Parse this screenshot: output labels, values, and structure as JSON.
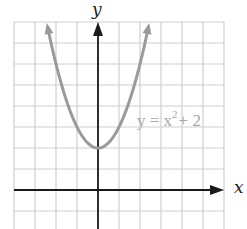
{
  "chart_data": {
    "type": "line",
    "title": "",
    "xlabel": "x",
    "ylabel": "y",
    "xlim": [
      -4,
      6
    ],
    "ylim": [
      -2,
      8
    ],
    "grid": true,
    "grid_step": 1,
    "tick_labels": false,
    "series": [
      {
        "name": "y = x² + 2",
        "equation": "y = x^2 + 2",
        "color": "#9a9a9a",
        "arrows_both_ends": true,
        "x_range": [
          -2.4,
          2.4
        ],
        "x": [
          -2.4,
          -2,
          -1.5,
          -1,
          -0.5,
          0,
          0.5,
          1,
          1.5,
          2,
          2.4
        ],
        "y": [
          7.76,
          6,
          4.25,
          3,
          2.25,
          2,
          2.25,
          3,
          4.25,
          6,
          7.76
        ]
      }
    ],
    "annotations": [
      {
        "text_main": "y = x",
        "superscript": "2",
        "text_tail": "+ 2",
        "x": 1.9,
        "y": 4.6
      }
    ]
  },
  "labels": {
    "x_axis": "x",
    "y_axis": "y",
    "curve_main": "y = x",
    "curve_sup": "2",
    "curve_tail": "+ 2"
  },
  "colors": {
    "grid": "#cfcfcf",
    "axis": "#1a1a1a",
    "curve": "#9a9a9a",
    "label": "#a8a8a8"
  }
}
